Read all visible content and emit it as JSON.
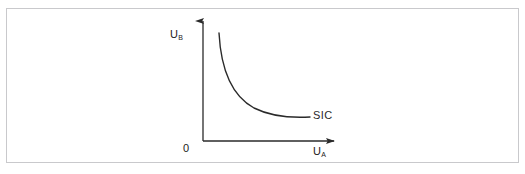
{
  "page": {
    "background_color": "#ffffff",
    "border_color": "#c9c9cc"
  },
  "diagram": {
    "type": "indifference-curve",
    "title": "",
    "ink_color": "#2a2a2a",
    "origin": {
      "label": "0",
      "x": 203,
      "y": 141
    },
    "y_axis": {
      "symbol": "U",
      "subscript": "B",
      "label": "U_B",
      "arrow": "up",
      "from_y": 141,
      "to_y": 14,
      "at_x": 203
    },
    "x_axis": {
      "symbol": "U",
      "subscript": "A",
      "label": "U_A",
      "arrow": "right",
      "from_x": 203,
      "to_x": 341,
      "at_y": 141
    },
    "curve": {
      "label": "SIC",
      "label_full": "Social Indifference Curve",
      "shape": "convex-to-origin",
      "start_point": [
        219,
        33
      ],
      "end_point": [
        310,
        117
      ],
      "stroke_color": "#2a2a2a",
      "stroke_width": 1.4
    }
  }
}
